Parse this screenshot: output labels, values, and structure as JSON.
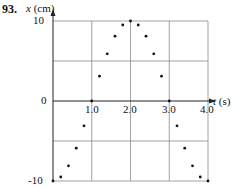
{
  "figure": {
    "problem_number": "93.",
    "y_axis_label_var": "x",
    "y_axis_label_unit": "(cm)",
    "x_axis_label_var": "t",
    "x_axis_label_unit": "(s)"
  },
  "chart_data": {
    "type": "scatter",
    "title": "",
    "xlabel": "t (s)",
    "ylabel": "x (cm)",
    "xlim": [
      0,
      4.0
    ],
    "ylim": [
      -10,
      10
    ],
    "x_ticks": [
      "1.0",
      "2.0",
      "3.0",
      "4.0"
    ],
    "y_ticks": [
      "10",
      "0",
      "-10"
    ],
    "grid": true,
    "grid_x": [
      1.0,
      2.0,
      3.0,
      4.0
    ],
    "grid_y": [
      -10,
      -5,
      0,
      5,
      10
    ],
    "series": [
      {
        "name": "x(t)",
        "x": [
          0,
          0.2,
          0.4,
          0.6,
          0.8,
          1.0,
          1.2,
          1.4,
          1.6,
          1.8,
          2.0,
          2.2,
          2.4,
          2.6,
          2.8,
          3.0,
          3.2,
          3.4,
          3.6,
          3.8,
          4.0
        ],
        "y": [
          -10,
          -9.5,
          -8.1,
          -5.9,
          -3.1,
          0,
          3.1,
          5.9,
          8.1,
          9.5,
          10,
          9.5,
          8.1,
          5.9,
          3.1,
          0,
          -3.1,
          -5.9,
          -8.1,
          -9.5,
          -10
        ]
      }
    ]
  }
}
